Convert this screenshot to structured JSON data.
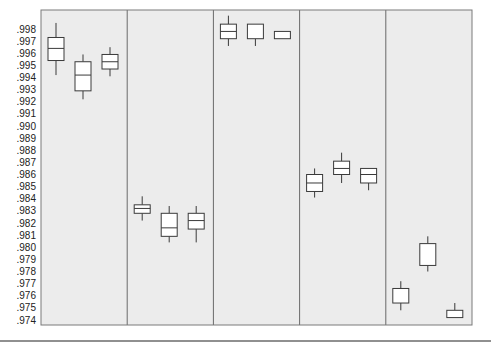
{
  "chart_data": {
    "type": "box",
    "title": "",
    "xlabel": "",
    "ylabel": "",
    "ylim": [
      0.9735,
      0.999
    ],
    "y_ticks": [
      ".998",
      ".997",
      ".996",
      ".995",
      ".994",
      ".993",
      ".992",
      ".991",
      ".990",
      ".989",
      ".988",
      ".987",
      ".986",
      ".985",
      ".984",
      ".983",
      ".982",
      ".981",
      ".980",
      ".979",
      ".978",
      ".977",
      ".976",
      ".975",
      ".974"
    ],
    "grid": false,
    "legend": null,
    "panels": [
      {
        "name": "panel-1",
        "boxes": [
          {
            "whisker_high": 0.9985,
            "q3": 0.9973,
            "median": 0.9964,
            "q1": 0.9954,
            "whisker_low": 0.9942
          },
          {
            "whisker_high": 0.9959,
            "q3": 0.9953,
            "median": 0.9942,
            "q1": 0.9929,
            "whisker_low": 0.9922
          },
          {
            "whisker_high": 0.9965,
            "q3": 0.9959,
            "median": 0.9953,
            "q1": 0.9947,
            "whisker_low": 0.9941
          }
        ]
      },
      {
        "name": "panel-2",
        "boxes": [
          {
            "whisker_high": 0.9842,
            "q3": 0.9835,
            "median": 0.9832,
            "q1": 0.9828,
            "whisker_low": 0.9822
          },
          {
            "whisker_high": 0.9834,
            "q3": 0.9828,
            "median": 0.9816,
            "q1": 0.9809,
            "whisker_low": 0.9804
          },
          {
            "whisker_high": 0.9834,
            "q3": 0.9828,
            "median": 0.9822,
            "q1": 0.9815,
            "whisker_low": 0.9804
          }
        ]
      },
      {
        "name": "panel-3",
        "boxes": [
          {
            "whisker_high": 0.9991,
            "q3": 0.9984,
            "median": 0.9978,
            "q1": 0.9972,
            "whisker_low": 0.9966
          },
          {
            "whisker_high": 0.9984,
            "q3": 0.9984,
            "median": 0.9984,
            "q1": 0.9972,
            "whisker_low": 0.9966
          },
          {
            "whisker_high": 0.9978,
            "q3": 0.9978,
            "median": 0.9978,
            "q1": 0.9972,
            "whisker_low": 0.9972
          }
        ]
      },
      {
        "name": "panel-4",
        "boxes": [
          {
            "whisker_high": 0.9865,
            "q3": 0.986,
            "median": 0.9853,
            "q1": 0.9846,
            "whisker_low": 0.9841
          },
          {
            "whisker_high": 0.9878,
            "q3": 0.9871,
            "median": 0.9865,
            "q1": 0.986,
            "whisker_low": 0.9853
          },
          {
            "whisker_high": 0.9865,
            "q3": 0.9865,
            "median": 0.986,
            "q1": 0.9853,
            "whisker_low": 0.9847
          }
        ]
      },
      {
        "name": "panel-5",
        "boxes": [
          {
            "whisker_high": 0.9772,
            "q3": 0.9766,
            "median": 0.9766,
            "q1": 0.9754,
            "whisker_low": 0.9748
          },
          {
            "whisker_high": 0.9809,
            "q3": 0.9803,
            "median": 0.9803,
            "q1": 0.9785,
            "whisker_low": 0.978
          },
          {
            "whisker_high": 0.9754,
            "q3": 0.9748,
            "median": 0.9748,
            "q1": 0.9742,
            "whisker_low": 0.9742
          }
        ]
      }
    ]
  },
  "colors": {
    "panel_background": "#ececec",
    "box_fill": "#ffffff",
    "box_stroke": "#3a3a3a",
    "frame": "#7a7a7a"
  }
}
